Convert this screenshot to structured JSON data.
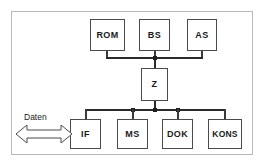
{
  "diagram": {
    "background_color": "#ffffff",
    "frame_color": "#b9b9b9",
    "node_border_color": "#4a4a4a",
    "wire_color": "#2b2b2b",
    "text_color": "#1a1a1a",
    "top_nodes": [
      {
        "id": "rom",
        "label": "ROM"
      },
      {
        "id": "bs",
        "label": "BS"
      },
      {
        "id": "as",
        "label": "AS"
      }
    ],
    "center_node": {
      "id": "z",
      "label": "Z"
    },
    "bottom_nodes": [
      {
        "id": "if",
        "label": "IF"
      },
      {
        "id": "ms",
        "label": "MS"
      },
      {
        "id": "dok",
        "label": "DOK"
      },
      {
        "id": "kons",
        "label": "KONS"
      }
    ],
    "annotations": [
      {
        "id": "daten",
        "label": "Daten",
        "icon": "double-arrow-horizontal"
      }
    ]
  }
}
